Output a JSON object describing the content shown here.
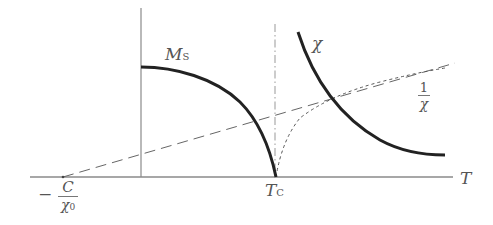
{
  "diagram": {
    "axes": {
      "x_label": "T",
      "x_ticks": [
        {
          "label": "T",
          "sub": "C",
          "meaning": "Curie temperature"
        },
        {
          "label_prefix": "−",
          "numerator": "C",
          "denominator": "χ",
          "den_sub": "0"
        }
      ]
    },
    "curves": [
      {
        "name": "Ms",
        "label": "M",
        "label_sub": "S",
        "style": "solid-thick"
      },
      {
        "name": "chi",
        "label": "χ",
        "style": "solid-thick"
      },
      {
        "name": "inverse-chi",
        "label_numerator": "1",
        "label_denominator": "χ",
        "style": "dotted"
      },
      {
        "name": "asymptote",
        "style": "dashed"
      },
      {
        "name": "tc-line",
        "style": "dash-dot"
      }
    ],
    "colors": {
      "axis": "#888888",
      "curve": "#222222",
      "dashed": "#666666",
      "label": "#555555"
    }
  }
}
